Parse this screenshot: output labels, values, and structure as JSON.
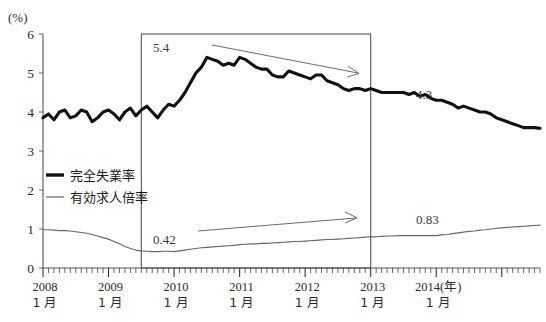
{
  "chart_data": {
    "type": "line",
    "title": "",
    "xlabel": "",
    "ylabel": "(%)",
    "y_unit_label": "(%)",
    "ylim": [
      0,
      6
    ],
    "yticks": [
      "0",
      "1",
      "2",
      "3",
      "4",
      "5",
      "6"
    ],
    "ytick_values": [
      0,
      1,
      2,
      3,
      4,
      5,
      6
    ],
    "grid": false,
    "legend_position": "inside-left",
    "x_start": "2008-01",
    "x_end": "2014-06",
    "xticks": [
      {
        "year": "2008",
        "month": "1 月",
        "suffix": ""
      },
      {
        "year": "2009",
        "month": "1 月",
        "suffix": ""
      },
      {
        "year": "2010",
        "month": "1 月",
        "suffix": ""
      },
      {
        "year": "2011",
        "month": "1 月",
        "suffix": ""
      },
      {
        "year": "2012",
        "month": "1 月",
        "suffix": ""
      },
      {
        "year": "2013",
        "month": "1 月",
        "suffix": ""
      },
      {
        "year": "2014",
        "month": "1 月",
        "suffix": "(年)"
      }
    ],
    "series": [
      {
        "name": "完全失業率",
        "style": "thick-black",
        "unit": "%",
        "values": [
          3.85,
          3.95,
          3.8,
          4.0,
          4.05,
          3.85,
          3.9,
          4.05,
          4.0,
          3.75,
          3.85,
          4.0,
          4.05,
          3.95,
          3.8,
          4.0,
          4.1,
          3.9,
          4.05,
          4.15,
          4.0,
          3.85,
          4.05,
          4.2,
          4.15,
          4.3,
          4.5,
          4.75,
          5.0,
          5.15,
          5.4,
          5.35,
          5.3,
          5.2,
          5.25,
          5.2,
          5.4,
          5.35,
          5.25,
          5.15,
          5.1,
          5.1,
          4.95,
          4.9,
          4.9,
          5.05,
          5.0,
          4.95,
          4.9,
          4.85,
          4.95,
          4.95,
          4.8,
          4.75,
          4.7,
          4.6,
          4.55,
          4.6,
          4.6,
          4.55,
          4.6,
          4.55,
          4.5,
          4.5,
          4.5,
          4.5,
          4.5,
          4.45,
          4.5,
          4.4,
          4.45,
          4.35,
          4.3,
          4.3,
          4.25,
          4.2,
          4.1,
          4.15,
          4.1,
          4.05,
          4.0,
          4.0,
          3.95,
          3.85,
          3.8,
          3.75,
          3.7,
          3.65,
          3.6,
          3.6,
          3.6,
          3.58
        ]
      },
      {
        "name": "有効求人倍率",
        "style": "thin-gray",
        "unit": "倍",
        "values": [
          0.98,
          0.98,
          0.97,
          0.96,
          0.96,
          0.95,
          0.93,
          0.91,
          0.89,
          0.86,
          0.82,
          0.78,
          0.74,
          0.68,
          0.62,
          0.55,
          0.5,
          0.46,
          0.44,
          0.43,
          0.42,
          0.42,
          0.43,
          0.43,
          0.42,
          0.44,
          0.46,
          0.48,
          0.5,
          0.52,
          0.53,
          0.54,
          0.55,
          0.56,
          0.57,
          0.58,
          0.6,
          0.61,
          0.62,
          0.62,
          0.63,
          0.63,
          0.64,
          0.65,
          0.66,
          0.67,
          0.68,
          0.68,
          0.69,
          0.7,
          0.71,
          0.72,
          0.73,
          0.73,
          0.74,
          0.75,
          0.76,
          0.77,
          0.78,
          0.79,
          0.8,
          0.8,
          0.81,
          0.82,
          0.82,
          0.83,
          0.83,
          0.83,
          0.83,
          0.83,
          0.83,
          0.83,
          0.83,
          0.85,
          0.86,
          0.88,
          0.9,
          0.92,
          0.94,
          0.95,
          0.97,
          0.98,
          1.0,
          1.02,
          1.03,
          1.04,
          1.05,
          1.06,
          1.07,
          1.08,
          1.09,
          1.1
        ]
      }
    ],
    "annotations": [
      {
        "name": "peak-unemployment",
        "text": "5.4",
        "series": "完全失業率",
        "value": 5.4
      },
      {
        "name": "end-box-unemployment",
        "text": "4.3",
        "series": "完全失業率",
        "value": 4.3
      },
      {
        "name": "trough-jobs-ratio",
        "text": "0.42",
        "series": "有効求人倍率",
        "value": 0.42
      },
      {
        "name": "end-box-jobs-ratio",
        "text": "0.83",
        "series": "有効求人倍率",
        "value": 0.83
      }
    ],
    "highlight_box": {
      "name": "highlight-region",
      "x_from": "2009-07",
      "x_to": "2013-01"
    },
    "trend_arrows": [
      {
        "name": "declining-trend-arrow",
        "direction": "down-right",
        "refers_to": "完全失業率"
      },
      {
        "name": "rising-trend-arrow",
        "direction": "up-right",
        "refers_to": "有効求人倍率"
      }
    ]
  },
  "legend": {
    "items": [
      {
        "label": "完全失業率",
        "style": "thick-black"
      },
      {
        "label": "有効求人倍率",
        "style": "thin-gray"
      }
    ]
  },
  "colors": {
    "unemployment_line": "#111111",
    "jobs_ratio_line": "#666666",
    "axis": "#555555",
    "background": "#ffffff",
    "annotation": "#6a6a6a"
  }
}
